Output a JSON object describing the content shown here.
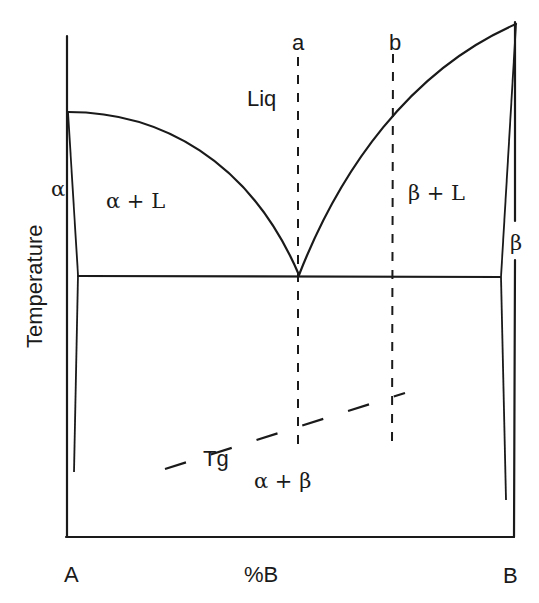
{
  "diagram": {
    "type": "binary eutectic phase diagram",
    "axes": {
      "y_label": "Temperature",
      "x_label": "%B",
      "left_component": "A",
      "right_component": "B"
    },
    "regions": {
      "liquid": "Liq",
      "alpha_plus_liquid": "α + L",
      "beta_plus_liquid": "β + L",
      "alpha": "α",
      "beta": "β",
      "alpha_plus_beta": "α + β"
    },
    "composition_lines": {
      "a": "a",
      "b": "b"
    },
    "glass_transition": {
      "label": "Tg"
    },
    "colors": {
      "line": "#1a1a1a",
      "background": "#ffffff"
    }
  }
}
